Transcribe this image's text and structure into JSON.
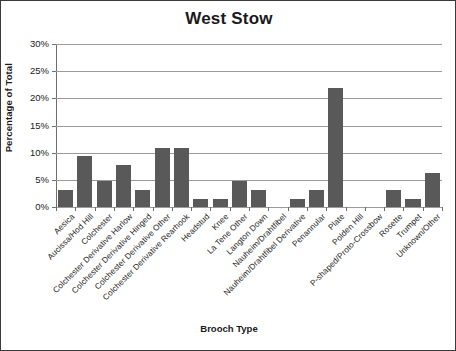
{
  "chart_data": {
    "type": "bar",
    "title": "West Stow",
    "xlabel": "Brooch Type",
    "ylabel": "Percentage of Total",
    "ylim": [
      0,
      30
    ],
    "ytick_labels": [
      "30%",
      "25%",
      "20%",
      "15%",
      "10%",
      "5%",
      "0%"
    ],
    "ytick_values": [
      30,
      25,
      20,
      15,
      10,
      5,
      0
    ],
    "grid": true,
    "legend": "none",
    "bar_color": "#595959",
    "categories": [
      "Aesica",
      "Aucissa/Hod Hill",
      "Colchester",
      "Colchester Derivative Harlow",
      "Colchester Derivative Hinged",
      "Colchester Derivative Other",
      "Colchester Derivative Rearhook",
      "Headstud",
      "Knee",
      "La Tene Other",
      "Langton Down",
      "Nauheim/Drahtfibel",
      "Nauheim/Drahtfibel Derivative",
      "Penannular",
      "Plate",
      "Polden Hill",
      "P-shaped/Proto-Crossbow",
      "Rosette",
      "Trumpet",
      "Unknown/Other"
    ],
    "values": [
      3.1,
      9.4,
      4.7,
      7.8,
      3.1,
      10.9,
      10.9,
      1.5,
      1.5,
      4.7,
      3.1,
      0,
      1.5,
      3.1,
      21.9,
      0,
      0,
      3.1,
      1.5,
      6.2
    ]
  }
}
